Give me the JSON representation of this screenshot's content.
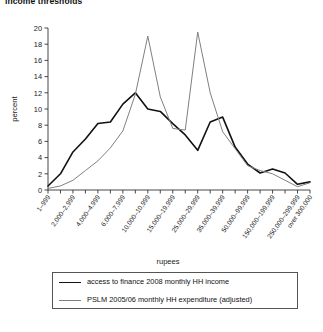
{
  "figure": {
    "title": "income thresholds"
  },
  "legend": {
    "items": [
      {
        "label": "access to finance 2008 monthly HH income",
        "color": "#111111",
        "style": "thick"
      },
      {
        "label": "PSLM 2005/06 monthly HH expenditure (adjusted)",
        "color": "#808080",
        "style": "thin"
      }
    ]
  },
  "chart_data": {
    "type": "line",
    "title": "income thresholds",
    "xlabel": "rupees",
    "ylabel": "percent",
    "ylim": [
      0,
      20
    ],
    "yticks": [
      0,
      2,
      4,
      6,
      8,
      10,
      12,
      14,
      16,
      18,
      20
    ],
    "grid": false,
    "legend_position": "bottom",
    "categories": [
      "1–999",
      "1,000–1,999",
      "2,000–2,999",
      "3,000–3,999",
      "4,000–4,999",
      "5,000–5,999",
      "6,000–7,999",
      "8,000–9,999",
      "10,000–10,999",
      "11,000–14,999",
      "15,000–19,999",
      "20,000–24,999",
      "25,000–29,999",
      "30,000–34,999",
      "35,000–39,999",
      "40,000–49,999",
      "50,000–99,999",
      "100,000–149,999",
      "150,000–199,999",
      "200,000–249,999",
      "250,000–299,999",
      "over 300,000"
    ],
    "tick_labels_shown": [
      "1–999",
      "2,000–2,999",
      "4,000–4,999",
      "6,000–7,999",
      "10,000–10,999",
      "15,000–19,999",
      "25,000–29,999",
      "35,000–39,999",
      "50,000–99,999",
      "150,000–199,999",
      "250,000–299,999",
      "over 300,000"
    ],
    "series": [
      {
        "name": "access to finance 2008 monthly HH income",
        "color": "#111111",
        "values": [
          0.5,
          2.0,
          4.7,
          6.3,
          8.2,
          8.4,
          10.6,
          12.0,
          10.0,
          9.7,
          8.2,
          6.8,
          4.9,
          8.4,
          9.0,
          5.3,
          3.2,
          2.1,
          2.6,
          2.1,
          0.7,
          1.0
        ]
      },
      {
        "name": "PSLM 2005/06 monthly HH expenditure (adjusted)",
        "color": "#808080",
        "values": [
          0.2,
          0.5,
          1.2,
          2.4,
          3.6,
          5.2,
          7.3,
          11.8,
          19.0,
          11.5,
          7.6,
          7.4,
          19.5,
          12.0,
          7.2,
          5.1,
          3.0,
          2.4,
          2.0,
          1.2,
          0.4,
          0.9
        ]
      }
    ]
  }
}
